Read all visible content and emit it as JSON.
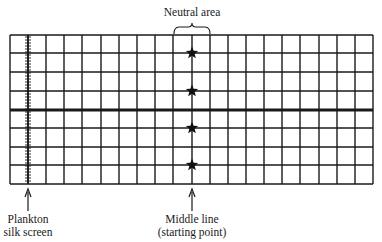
{
  "diagram": {
    "type": "grid-illustration",
    "labels": {
      "neutral_area": "Neutral area",
      "plankton_line1": "Plankton",
      "plankton_line2": "silk screen",
      "middle_line1": "Middle line",
      "middle_line2": "(starting point)"
    },
    "grid": {
      "left": 10,
      "right": 373,
      "top": 35,
      "bottom": 184,
      "columns_x": [
        10,
        28,
        46,
        64,
        82,
        101,
        119,
        137,
        155,
        173,
        192,
        210,
        228,
        246,
        264,
        282,
        300,
        319,
        337,
        355,
        373
      ],
      "rows_y": [
        35,
        53,
        72,
        91,
        110,
        128,
        147,
        165,
        184
      ],
      "thick_row_y": 110,
      "line_color": "#1a1a1a"
    },
    "silk_screen": {
      "x": 28,
      "tick_spacing": 3,
      "tick_half_width": 3
    },
    "middle_line": {
      "x": 192
    },
    "stars": [
      {
        "x": 192,
        "y": 53
      },
      {
        "x": 192,
        "y": 91
      },
      {
        "x": 192,
        "y": 128
      },
      {
        "x": 192,
        "y": 165
      }
    ],
    "brace": {
      "x1": 174,
      "x2": 210,
      "y": 27
    }
  }
}
